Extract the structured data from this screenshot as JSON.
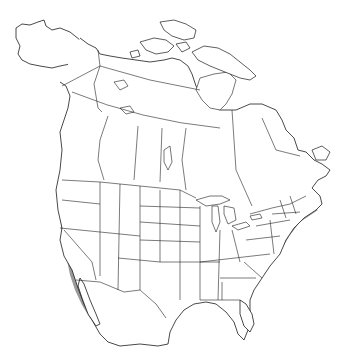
{
  "map": {
    "region": "North America",
    "type": "species range map",
    "legend_visible": false,
    "colors": {
      "background": "#ffffff",
      "outline": "#1a1a1a",
      "range_primary": "#9a9a9a",
      "range_secondary": "#d6d6d6",
      "range_dense": "#7d7d7d"
    },
    "layers": [
      {
        "name": "coastlines",
        "style": "black outline"
      },
      {
        "name": "political-boundaries",
        "style": "thin black lines (states, provinces, countries)"
      },
      {
        "name": "range-primary",
        "style": "medium gray fill",
        "extent": "Eastern and central USA, southern Canada prairies, western mountains, Mexico"
      },
      {
        "name": "range-secondary",
        "style": "light gray fill",
        "extent": "Northern fringe in Canada, arid Southwest, parts of Great Basin"
      }
    ]
  }
}
